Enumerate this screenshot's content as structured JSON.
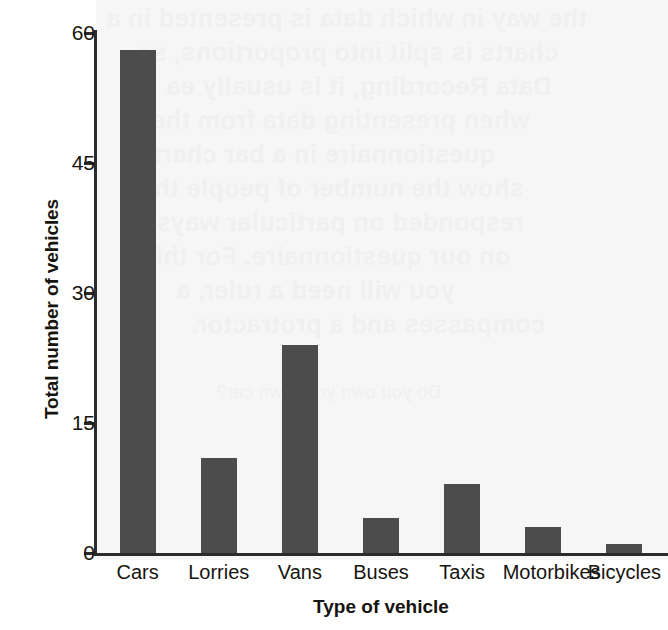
{
  "chart_data": {
    "type": "bar",
    "title": "",
    "xlabel": "Type of vehicle",
    "ylabel": "Total number of vehicles",
    "categories": [
      "Cars",
      "Lorries",
      "Vans",
      "Buses",
      "Taxis",
      "Motorbikes",
      "Bicycles"
    ],
    "values": [
      58,
      11,
      24,
      4,
      8,
      3,
      1
    ],
    "ylim": [
      0,
      60
    ],
    "yticks": [
      0,
      15,
      30,
      45,
      60
    ],
    "ytick_labels": [
      "0",
      "15",
      "30",
      "45",
      "60"
    ],
    "grid": false,
    "legend": false,
    "bar_color": "#4c4c4c",
    "axis_color": "#2b2b2b",
    "background_color": "#ffffff"
  },
  "background_bleed": {
    "description": "faint reverse-side print showing through scanned page",
    "lines": [
      "the way in which data is presented in a",
      "charts is split into proportions, so",
      "Data Recording, it is usually ea",
      "when presenting data from the",
      "questionnaire in a bar chart to",
      "show the number of people that",
      "responded on particular ways",
      "on our questionnaire. For this",
      "you will need a ruler, a",
      "compasses and a protractor.",
      "Do you own your own car?"
    ]
  }
}
